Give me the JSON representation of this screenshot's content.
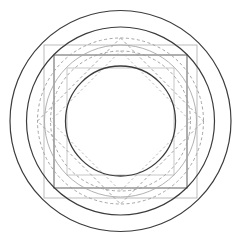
{
  "figure": {
    "width": 241,
    "height": 244,
    "background_color": "#ffffff",
    "center": {
      "x": 120.5,
      "y": 121.0
    },
    "colors": {
      "dark_stroke": "#3c3c3c",
      "mid_stroke": "#6e6e6e",
      "light_stroke": "#a8a8a8",
      "faint_stroke": "#c2c2c2",
      "dashed_stroke": "#9a9a9a",
      "background": "#ffffff"
    }
  },
  "chart_data": {
    "type": "scatter",
    "xlabel": "",
    "ylabel": "",
    "xlim": [
      0,
      241
    ],
    "ylim": [
      0,
      244
    ],
    "grid": false,
    "legend": false,
    "center": {
      "x": 120.5,
      "y": 121.0
    },
    "circles": [
      {
        "name": "outer-circle",
        "cx": 120.5,
        "cy": 121.0,
        "r": 110.5,
        "stroke": "#3c3c3c",
        "stroke_width": 1.2,
        "dash": "none",
        "fill": "none"
      },
      {
        "name": "second-circle",
        "cx": 120.5,
        "cy": 121.0,
        "r": 94.0,
        "stroke": "#3c3c3c",
        "stroke_width": 1.2,
        "dash": "none",
        "fill": "none"
      },
      {
        "name": "dashed-outer-circle",
        "cx": 120.5,
        "cy": 121.0,
        "r": 83.0,
        "stroke": "#9a9a9a",
        "stroke_width": 0.9,
        "dash": "3,2.5",
        "fill": "none"
      },
      {
        "name": "light-circle",
        "cx": 120.5,
        "cy": 121.0,
        "r": 76.0,
        "stroke": "#a8a8a8",
        "stroke_width": 0.9,
        "dash": "none",
        "fill": "none"
      },
      {
        "name": "dashed-inner-circle",
        "cx": 120.5,
        "cy": 121.0,
        "r": 70.0,
        "stroke": "#9a9a9a",
        "stroke_width": 0.9,
        "dash": "3,2.5",
        "fill": "none"
      },
      {
        "name": "inner-circle",
        "cx": 120.5,
        "cy": 121.0,
        "r": 55.0,
        "stroke": "#3c3c3c",
        "stroke_width": 1.3,
        "dash": "none",
        "fill": "none"
      }
    ],
    "squares": [
      {
        "name": "outer-square",
        "x": 44.0,
        "y": 45.0,
        "size": 153.0,
        "stroke": "#b4b4b4",
        "stroke_width": 0.9,
        "dash": "none",
        "fill": "none"
      },
      {
        "name": "middle-square",
        "x": 54.0,
        "y": 55.0,
        "size": 133.0,
        "stroke": "#6e6e6e",
        "stroke_width": 1.1,
        "dash": "none",
        "fill": "none"
      },
      {
        "name": "inner-square",
        "x": 67.0,
        "y": 68.0,
        "size": 107.0,
        "stroke": "#c2c2c2",
        "stroke_width": 0.9,
        "dash": "none",
        "fill": "none"
      }
    ],
    "diamonds": [
      {
        "name": "dashed-diamond-outer",
        "points": "120.5,38.0 203.5,121.0 120.5,204.0 37.5,121.0",
        "stroke": "#9a9a9a",
        "stroke_width": 0.9,
        "dash": "3,2.5",
        "fill": "none"
      },
      {
        "name": "dashed-diamond-inner",
        "points": "120.5,51.0 190.5,121.0 120.5,191.0 50.5,121.0",
        "stroke": "#a8a8a8",
        "stroke_width": 0.8,
        "dash": "2.5,2.5",
        "fill": "none"
      }
    ],
    "annotations": [
      {
        "name": "radii",
        "values": [
          110.5,
          94.0,
          83.0,
          76.0,
          70.0,
          55.0
        ]
      },
      {
        "name": "square-half-sizes",
        "values": [
          76.5,
          66.5,
          53.5
        ]
      }
    ]
  }
}
